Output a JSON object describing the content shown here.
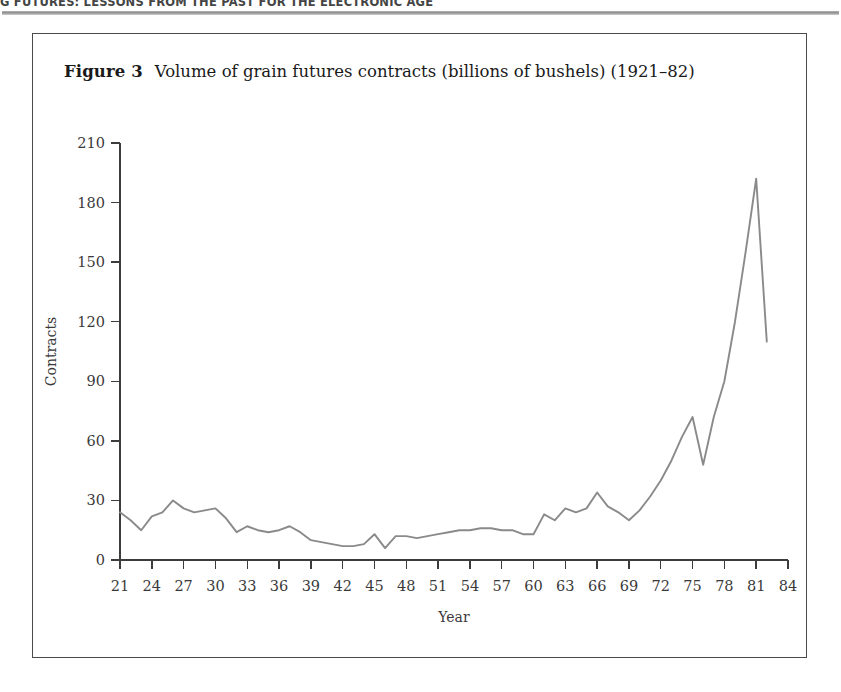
{
  "page": {
    "running_head": "G FUTURES: LESSONS FROM THE PAST FOR THE ELECTRONIC AGE"
  },
  "figure": {
    "label": "Figure 3",
    "caption": "Volume of grain futures contracts (billions of bushels) (1921–82)"
  },
  "colors": {
    "line": "#8a8a8a",
    "axis": "#3c3c3c",
    "frame": "#4a4a4a",
    "text": "#1a1a1a",
    "tick_text": "#3a3a3a"
  },
  "chart_data": {
    "type": "line",
    "title": "Volume of grain futures contracts (billions of bushels) (1921–82)",
    "xlabel": "Year",
    "ylabel": "Contracts",
    "xlim": [
      21,
      84
    ],
    "ylim": [
      0,
      210
    ],
    "xticks": [
      21,
      24,
      27,
      30,
      33,
      36,
      39,
      42,
      45,
      48,
      51,
      54,
      57,
      60,
      63,
      66,
      69,
      72,
      75,
      78,
      81,
      84
    ],
    "xtick_labels": [
      "21",
      "24",
      "27",
      "30",
      "33",
      "36",
      "39",
      "42",
      "45",
      "48",
      "51",
      "54",
      "57",
      "60",
      "63",
      "66",
      "69",
      "72",
      "75",
      "78",
      "81",
      "84"
    ],
    "yticks": [
      0,
      30,
      60,
      90,
      120,
      150,
      180,
      210
    ],
    "ytick_labels": [
      "0",
      "30",
      "60",
      "90",
      "120",
      "150",
      "180",
      "210"
    ],
    "grid": false,
    "legend": null,
    "series": [
      {
        "name": "Volume of grain futures contracts",
        "x": [
          21,
          22,
          23,
          24,
          25,
          26,
          27,
          28,
          29,
          30,
          31,
          32,
          33,
          34,
          35,
          36,
          37,
          38,
          39,
          40,
          41,
          42,
          43,
          44,
          45,
          46,
          47,
          48,
          49,
          50,
          51,
          52,
          53,
          54,
          55,
          56,
          57,
          58,
          59,
          60,
          61,
          62,
          63,
          64,
          65,
          66,
          67,
          68,
          69,
          70,
          71,
          72,
          73,
          74,
          75,
          76,
          77,
          78,
          79,
          80,
          81,
          82
        ],
        "values": [
          24,
          20,
          15,
          22,
          24,
          30,
          26,
          24,
          25,
          26,
          21,
          14,
          17,
          15,
          14,
          15,
          17,
          14,
          10,
          9,
          8,
          7,
          7,
          8,
          13,
          6,
          12,
          12,
          11,
          12,
          13,
          14,
          15,
          15,
          16,
          16,
          15,
          15,
          13,
          13,
          23,
          20,
          26,
          24,
          26,
          34,
          27,
          24,
          20,
          25,
          32,
          40,
          50,
          62,
          72,
          48,
          72,
          90,
          120,
          155,
          192,
          110
        ]
      }
    ]
  }
}
